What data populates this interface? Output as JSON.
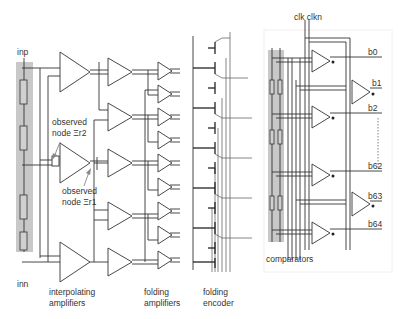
{
  "figure": {
    "labels": {
      "inp": "inp",
      "inn": "inn",
      "observed_node_1": [
        "observed",
        "node Ξr2"
      ],
      "observed_node_2": [
        "observed",
        "node Ξr1"
      ],
      "interpolating_amplifiers": [
        "interpolating",
        "amplifiers"
      ],
      "folding_amplifiers": [
        "folding",
        "amplifiers"
      ],
      "folding_encoder": [
        "folding",
        "encoder"
      ],
      "comparators": "comparators",
      "clocks": "clk clkn"
    },
    "outputs": [
      "b0",
      "b1",
      "b2",
      "b62",
      "b63",
      "b64"
    ],
    "colors": {
      "ladder_fill": "#c8c8c8",
      "line": "#333333",
      "arrow": "#888888"
    }
  }
}
